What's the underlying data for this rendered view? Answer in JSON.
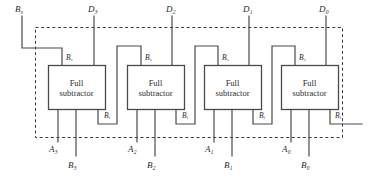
{
  "diagram": {
    "colors": {
      "line": "#4a4a4a",
      "text": "#2b2b2b",
      "dashed_border": "#3a3a3a",
      "background": "#ffffff"
    },
    "dashed_boundary": {
      "x": 35,
      "y": 27,
      "width": 308,
      "height": 111
    },
    "block_label_line1": "Full",
    "block_label_line2": "subtractor",
    "borrow_in_label": "B",
    "borrow_in_sub": "s",
    "borrow_out_label": "B",
    "borrow_out_sub": "i",
    "external_borrow": {
      "base": "B",
      "sub": "s"
    },
    "blocks": [
      {
        "id": "fs3",
        "line1": "Full",
        "line2": "subtractor",
        "diff_label": {
          "base": "D",
          "sub": "3"
        },
        "a_label": {
          "base": "A",
          "sub": "3"
        },
        "b_label": {
          "base": "B",
          "sub": "3"
        },
        "bs_label": {
          "base": "B",
          "sub": "s"
        },
        "bi_label": {
          "base": "B",
          "sub": "i"
        }
      },
      {
        "id": "fs2",
        "line1": "Full",
        "line2": "subtractor",
        "diff_label": {
          "base": "D",
          "sub": "2"
        },
        "a_label": {
          "base": "A",
          "sub": "2"
        },
        "b_label": {
          "base": "B",
          "sub": "2"
        },
        "bs_label": {
          "base": "B",
          "sub": "s"
        },
        "bi_label": {
          "base": "B",
          "sub": "i"
        }
      },
      {
        "id": "fs1",
        "line1": "Full",
        "line2": "subtractor",
        "diff_label": {
          "base": "D",
          "sub": "1"
        },
        "a_label": {
          "base": "A",
          "sub": "1"
        },
        "b_label": {
          "base": "B",
          "sub": "1"
        },
        "bs_label": {
          "base": "B",
          "sub": "s"
        },
        "bi_label": {
          "base": "B",
          "sub": "i"
        }
      },
      {
        "id": "fs0",
        "line1": "Full",
        "line2": "subtractor",
        "diff_label": {
          "base": "D",
          "sub": "0"
        },
        "a_label": {
          "base": "A",
          "sub": "0"
        },
        "b_label": {
          "base": "B",
          "sub": "0"
        },
        "bs_label": {
          "base": "B",
          "sub": "s"
        },
        "bi_label": {
          "base": "B",
          "sub": "i"
        }
      }
    ],
    "top_labels": [
      {
        "name": "external-borrow-in",
        "base": "B",
        "sub": "s",
        "x": 15,
        "y": 5
      },
      {
        "name": "difference-3",
        "base": "D",
        "sub": "3",
        "x": 88,
        "y": 5
      },
      {
        "name": "difference-2",
        "base": "D",
        "sub": "2",
        "x": 166,
        "y": 5
      },
      {
        "name": "difference-1",
        "base": "D",
        "sub": "1",
        "x": 243,
        "y": 5
      },
      {
        "name": "difference-0",
        "base": "D",
        "sub": "0",
        "x": 319,
        "y": 5
      }
    ],
    "bottom_labels": [
      {
        "name": "minuend-3",
        "base": "A",
        "sub": "3",
        "x": 52,
        "y": 149
      },
      {
        "name": "subtrahend-3",
        "base": "B",
        "sub": "3",
        "x": 70,
        "y": 163
      },
      {
        "name": "minuend-2",
        "base": "A",
        "sub": "2",
        "x": 131,
        "y": 149
      },
      {
        "name": "subtrahend-2",
        "base": "B",
        "sub": "2",
        "x": 150,
        "y": 163
      },
      {
        "name": "minuend-1",
        "base": "A",
        "sub": "1",
        "x": 208,
        "y": 149
      },
      {
        "name": "subtrahend-1",
        "base": "B",
        "sub": "1",
        "x": 227,
        "y": 163
      },
      {
        "name": "minuend-0",
        "base": "A",
        "sub": "0",
        "x": 285,
        "y": 149
      },
      {
        "name": "subtrahend-0",
        "base": "B",
        "sub": "0",
        "x": 304,
        "y": 163
      }
    ],
    "pin_labels": [
      {
        "name": "fs3-borrow-in-pin",
        "base": "B",
        "sub": "s",
        "x": 58,
        "y": 55
      },
      {
        "name": "fs2-borrow-in-pin",
        "base": "B",
        "sub": "s",
        "x": 137,
        "y": 55
      },
      {
        "name": "fs1-borrow-in-pin",
        "base": "B",
        "sub": "s",
        "x": 215,
        "y": 55
      },
      {
        "name": "fs0-borrow-in-pin",
        "base": "B",
        "sub": "s",
        "x": 292,
        "y": 55
      },
      {
        "name": "fs3-borrow-out-pin",
        "base": "B",
        "sub": "i",
        "x": 108,
        "y": 113
      },
      {
        "name": "fs2-borrow-out-pin",
        "base": "B",
        "sub": "i",
        "x": 186,
        "y": 113
      },
      {
        "name": "fs1-borrow-out-pin",
        "base": "B",
        "sub": "i",
        "x": 263,
        "y": 113
      },
      {
        "name": "fs0-borrow-out-pin",
        "base": "B",
        "sub": "i",
        "x": 337,
        "y": 113
      }
    ],
    "block_text_positions": [
      {
        "x": 48,
        "y": 78,
        "w": 57
      },
      {
        "x": 127,
        "y": 78,
        "w": 57
      },
      {
        "x": 204,
        "y": 78,
        "w": 57
      },
      {
        "x": 281,
        "y": 78,
        "w": 57
      }
    ]
  }
}
